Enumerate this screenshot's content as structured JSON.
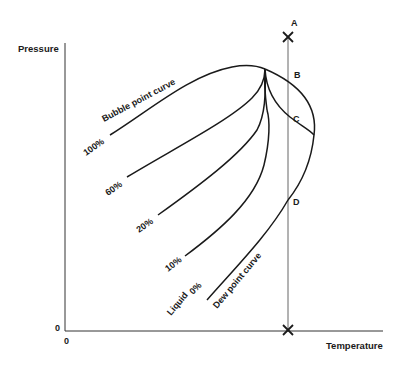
{
  "diagram": {
    "axes": {
      "y_label": "Pressure",
      "x_label": "Temperature",
      "y_origin": "0",
      "x_origin": "0"
    },
    "points": {
      "A": "A",
      "B": "B",
      "C": "C",
      "D": "D"
    },
    "curve_labels": {
      "bubble": "Bubble point curve",
      "dew": "Dew point curve",
      "liquid": "Liquid"
    },
    "quality_lines": [
      {
        "label": "100%"
      },
      {
        "label": "60%"
      },
      {
        "label": "20%"
      },
      {
        "label": "10%"
      },
      {
        "label": "0%"
      }
    ],
    "colors": {
      "ink": "#1a1a1a",
      "background": "#ffffff"
    }
  }
}
